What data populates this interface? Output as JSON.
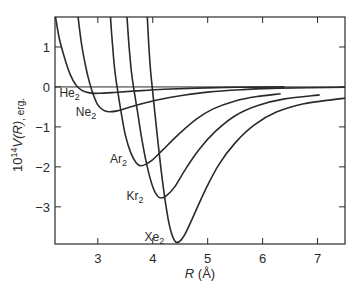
{
  "chart_data": {
    "type": "line",
    "title": "",
    "xlabel": "R (Å)",
    "ylabel": "10^14 V(R), erg.",
    "xlim": [
      2.22,
      7.5
    ],
    "ylim": [
      -3.93,
      1.75
    ],
    "grid": false,
    "legend_position": "inline labels",
    "x_ticks": [
      3,
      4,
      5,
      6,
      7
    ],
    "y_ticks": [
      1,
      0,
      -1,
      -2,
      -3
    ],
    "x_tick_labels": [
      "3",
      "4",
      "5",
      "6",
      "7"
    ],
    "y_tick_labels": [
      "1",
      "0",
      "−1",
      "−2",
      "−3"
    ],
    "zero_line": true,
    "series": [
      {
        "name": "He2",
        "label": "He",
        "sub": "2",
        "label_pos": [
          2.3,
          -0.25
        ],
        "points": [
          [
            2.23,
            1.75
          ],
          [
            2.3,
            1.2
          ],
          [
            2.4,
            0.7
          ],
          [
            2.5,
            0.3
          ],
          [
            2.6,
            0.05
          ],
          [
            2.7,
            -0.08
          ],
          [
            2.85,
            -0.15
          ],
          [
            3.0,
            -0.16
          ],
          [
            3.3,
            -0.14
          ],
          [
            3.7,
            -0.1
          ],
          [
            4.2,
            -0.06
          ],
          [
            4.8,
            -0.03
          ],
          [
            5.5,
            -0.01
          ],
          [
            6.4,
            0.0
          ]
        ]
      },
      {
        "name": "Ne2",
        "label": "Ne",
        "sub": "2",
        "label_pos": [
          2.6,
          -0.73
        ],
        "points": [
          [
            2.64,
            1.75
          ],
          [
            2.7,
            1.1
          ],
          [
            2.78,
            0.5
          ],
          [
            2.85,
            0.1
          ],
          [
            2.92,
            -0.2
          ],
          [
            3.0,
            -0.45
          ],
          [
            3.1,
            -0.58
          ],
          [
            3.2,
            -0.62
          ],
          [
            3.35,
            -0.6
          ],
          [
            3.55,
            -0.52
          ],
          [
            3.8,
            -0.42
          ],
          [
            4.1,
            -0.32
          ],
          [
            4.5,
            -0.22
          ],
          [
            5.0,
            -0.13
          ],
          [
            5.6,
            -0.07
          ],
          [
            6.3,
            -0.03
          ],
          [
            7.5,
            -0.01
          ]
        ]
      },
      {
        "name": "Ar2",
        "label": "Ar",
        "sub": "2",
        "label_pos": [
          3.22,
          -1.9
        ],
        "points": [
          [
            3.23,
            1.75
          ],
          [
            3.27,
            1.0
          ],
          [
            3.31,
            0.4
          ],
          [
            3.35,
            0.0
          ],
          [
            3.42,
            -0.6
          ],
          [
            3.5,
            -1.2
          ],
          [
            3.6,
            -1.65
          ],
          [
            3.7,
            -1.9
          ],
          [
            3.78,
            -1.97
          ],
          [
            3.88,
            -1.93
          ],
          [
            4.0,
            -1.82
          ],
          [
            4.2,
            -1.55
          ],
          [
            4.5,
            -1.15
          ],
          [
            4.8,
            -0.8
          ],
          [
            5.1,
            -0.55
          ],
          [
            5.5,
            -0.35
          ],
          [
            5.9,
            -0.24
          ],
          [
            6.33,
            -0.17
          ]
        ]
      },
      {
        "name": "Kr2",
        "label": "Kr",
        "sub": "2",
        "label_pos": [
          3.52,
          -2.82
        ],
        "points": [
          [
            3.53,
            1.75
          ],
          [
            3.57,
            1.0
          ],
          [
            3.61,
            0.4
          ],
          [
            3.65,
            0.0
          ],
          [
            3.72,
            -0.6
          ],
          [
            3.8,
            -1.3
          ],
          [
            3.9,
            -2.0
          ],
          [
            4.0,
            -2.5
          ],
          [
            4.08,
            -2.72
          ],
          [
            4.15,
            -2.78
          ],
          [
            4.25,
            -2.72
          ],
          [
            4.4,
            -2.5
          ],
          [
            4.6,
            -2.05
          ],
          [
            4.85,
            -1.55
          ],
          [
            5.15,
            -1.1
          ],
          [
            5.5,
            -0.72
          ],
          [
            5.9,
            -0.47
          ],
          [
            6.4,
            -0.3
          ],
          [
            7.04,
            -0.2
          ]
        ]
      },
      {
        "name": "Xe2",
        "label": "Xe",
        "sub": "2",
        "label_pos": [
          3.85,
          -3.85
        ],
        "points": [
          [
            3.9,
            1.75
          ],
          [
            3.93,
            1.0
          ],
          [
            3.96,
            0.4
          ],
          [
            3.99,
            0.0
          ],
          [
            4.05,
            -0.8
          ],
          [
            4.12,
            -1.7
          ],
          [
            4.2,
            -2.6
          ],
          [
            4.28,
            -3.3
          ],
          [
            4.35,
            -3.7
          ],
          [
            4.42,
            -3.88
          ],
          [
            4.5,
            -3.85
          ],
          [
            4.6,
            -3.65
          ],
          [
            4.75,
            -3.2
          ],
          [
            4.95,
            -2.6
          ],
          [
            5.2,
            -1.95
          ],
          [
            5.5,
            -1.4
          ],
          [
            5.85,
            -0.95
          ],
          [
            6.25,
            -0.63
          ],
          [
            6.75,
            -0.42
          ],
          [
            7.5,
            -0.28
          ]
        ]
      }
    ]
  },
  "axes": {
    "x_title_main": "R",
    "x_title_unit": " (Å)",
    "y_title_prefix": "10",
    "y_title_exp": "14",
    "y_title_main": "V(R)",
    "y_title_unit": ", erg."
  }
}
